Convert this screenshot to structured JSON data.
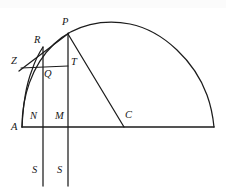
{
  "figure": {
    "stroke_color": "#1c1c1c",
    "background_color": "#ffffff",
    "width": 226,
    "height": 193,
    "labels": [
      {
        "id": "P",
        "text": "P",
        "x": 62,
        "y": 22
      },
      {
        "id": "R",
        "text": "R",
        "x": 35,
        "y": 40
      },
      {
        "id": "Z",
        "text": "Z",
        "x": 13,
        "y": 58
      },
      {
        "id": "T",
        "text": "T",
        "x": 71,
        "y": 60
      },
      {
        "id": "Q",
        "text": "Q",
        "x": 44,
        "y": 71
      },
      {
        "id": "N",
        "text": "N",
        "x": 30,
        "y": 115
      },
      {
        "id": "M",
        "text": "M",
        "x": 55,
        "y": 115
      },
      {
        "id": "C",
        "text": "C",
        "x": 125,
        "y": 114
      },
      {
        "id": "A",
        "text": "A",
        "x": 12,
        "y": 124
      },
      {
        "id": "S1",
        "text": "S",
        "x": 33,
        "y": 168
      },
      {
        "id": "S2",
        "text": "S",
        "x": 58,
        "y": 168
      }
    ],
    "points": {
      "A": {
        "x": 22,
        "y": 127
      },
      "N": {
        "x": 43,
        "y": 127
      },
      "M": {
        "x": 68,
        "y": 127
      },
      "C": {
        "x": 123,
        "y": 127
      },
      "B": {
        "x": 214,
        "y": 127
      },
      "P": {
        "x": 68,
        "y": 33
      },
      "Q": {
        "x": 43,
        "y": 66
      },
      "T": {
        "x": 68,
        "y": 66
      },
      "Z": {
        "x": 22,
        "y": 69
      },
      "R": {
        "x": 42,
        "y": 49
      }
    },
    "segments": [
      {
        "name": "baseline-A-B",
        "from": "A",
        "to": "B"
      },
      {
        "name": "chord-P-C",
        "from": "P",
        "to": "C"
      },
      {
        "name": "horizontal-Z-T",
        "from": "Z",
        "to": "T"
      },
      {
        "name": "tangent-Z-P",
        "from": "Z",
        "to": "P"
      },
      {
        "name": "vertical-N-line",
        "x": 43,
        "y1": 47,
        "y2": 185
      },
      {
        "name": "vertical-M-line",
        "x": 68,
        "y1": 33,
        "y2": 185
      }
    ],
    "arcs": [
      {
        "name": "main-arc-A-B",
        "description": "large circular arc from A rising over P to the right end of the baseline",
        "path": "M 22 127 C 22 96 33 62 57 41 C 78 23 106 20 131 25 C 165 32 196 64 208 98 C 211 107 213 117 214 127"
      },
      {
        "name": "cycloid-arc-A-R",
        "description": "steep inner curve from A through Q up to R",
        "path": "M 22 127 C 24 104 28 82 34 66 C 37 58 40 52 43 47"
      }
    ]
  }
}
